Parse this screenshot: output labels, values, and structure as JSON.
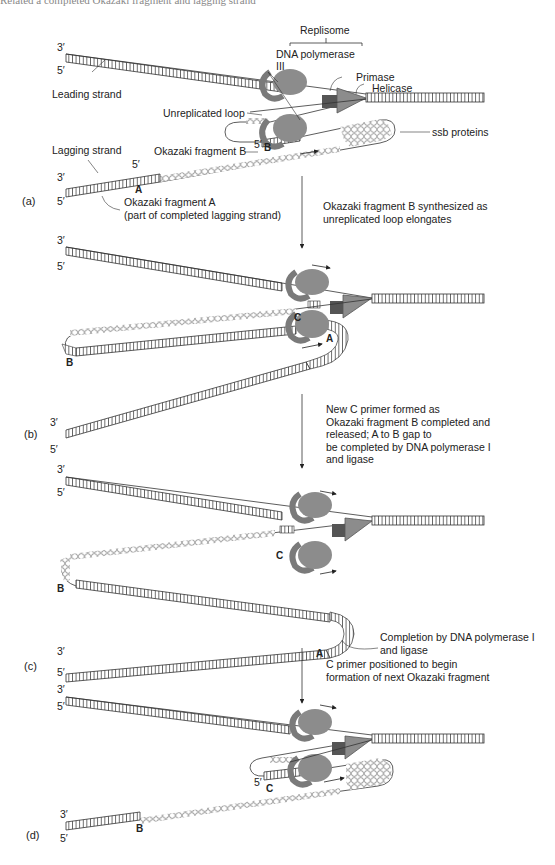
{
  "header": {
    "clipped_caption": "Related a completed Okazaki fragment and lagging strand"
  },
  "labels": {
    "replisome": "Replisome",
    "dna_polymerase": "DNA polymerase",
    "pol_iii": "III",
    "primase": "Primase",
    "helicase": "Helicase",
    "leading_strand": "Leading strand",
    "unreplicated_loop": "Unreplicated loop",
    "ssb_proteins": "ssb proteins",
    "lagging_strand": "Lagging strand",
    "okazaki_b": "Okazaki fragment B",
    "okazaki_a": "Okazaki fragment A",
    "okazaki_a_note": "(part of completed lagging strand)",
    "three_prime": "3′",
    "five_prime": "5′",
    "frag_a": "A",
    "frag_b": "B",
    "frag_c": "C"
  },
  "panels": [
    {
      "id": "a",
      "label": "(a)",
      "caption": "Okazaki fragment B synthesized as\nunreplicated loop elongates"
    },
    {
      "id": "b",
      "label": "(b)",
      "caption": "New C primer formed as\nOkazaki fragment B completed and\nreleased;  A to B gap to\nbe completed by DNA polymerase I\nand ligase"
    },
    {
      "id": "c",
      "label": "(c)",
      "caption": "C primer positioned to begin\nformation of next Okazaki fragment",
      "note": "Completion by DNA polymerase I\nand ligase"
    },
    {
      "id": "d",
      "label": "(d)"
    }
  ],
  "colors": {
    "protein": "#8c8c8c",
    "protein_dark": "#6e6e6e",
    "primase": "#555555",
    "strand": "#333333",
    "bg": "#ffffff"
  }
}
